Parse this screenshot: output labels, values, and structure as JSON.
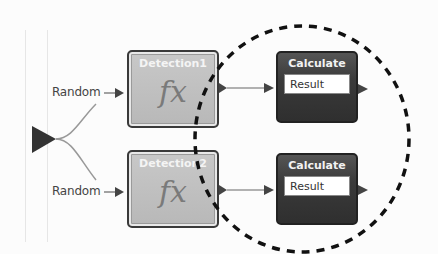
{
  "diagram": {
    "source_port": {
      "shape": "triangle",
      "color": "#333333"
    },
    "inputs": [
      {
        "label": "Random"
      },
      {
        "label": "Random"
      }
    ],
    "detection_nodes": [
      {
        "title": "Detection1",
        "icon": "fx-function-icon",
        "icon_text": "fx"
      },
      {
        "title": "Detection2",
        "icon": "fx-function-icon",
        "icon_text": "fx"
      }
    ],
    "calculate_nodes": [
      {
        "title": "Calculate",
        "field": "Result"
      },
      {
        "title": "Calculate",
        "field": "Result"
      }
    ],
    "highlight": {
      "shape": "dashed-circle",
      "color": "#111111"
    },
    "colors": {
      "background": "#fcfcfc",
      "detection_fill": "#c0c0c0",
      "calculate_fill": "#3a3a3a",
      "connector": "#888888",
      "arrow": "#444444"
    }
  }
}
